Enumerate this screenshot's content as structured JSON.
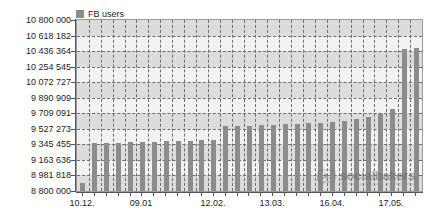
{
  "chart_data": {
    "type": "bar",
    "title": "",
    "subtitle": "",
    "xlabel": "",
    "ylabel": "",
    "ylim": [
      8800000,
      10800000
    ],
    "grid": true,
    "legend_position": "top-left",
    "series": [
      {
        "name": "FB users",
        "color": "#8c8c8c",
        "values": [
          8890000,
          9360000,
          9360000,
          9365000,
          9370000,
          9370000,
          9375000,
          9380000,
          9385000,
          9390000,
          9395000,
          9400000,
          9555000,
          9560000,
          9565000,
          9570000,
          9575000,
          9580000,
          9585000,
          9590000,
          9600000,
          9610000,
          9620000,
          9640000,
          9660000,
          9700000,
          9760000,
          10460000,
          10470000
        ]
      }
    ],
    "y_ticks": [
      "8 800 000",
      "8 981 818",
      "9 163 636",
      "9 345 455",
      "9 527 273",
      "9 709 091",
      "9 890 909",
      "10 072 727",
      "10 254 545",
      "10 436 364",
      "10 618 182",
      "10 800 000"
    ],
    "y_tick_values": [
      8800000,
      8981818,
      9163636,
      9345455,
      9527273,
      9709091,
      9890909,
      10072727,
      10254545,
      10436364,
      10618182,
      10800000
    ],
    "x_tick_labels": [
      "10.12.",
      "09.01",
      "12.02.",
      "13.03.",
      "16.04.",
      "17.05."
    ],
    "x_tick_label_indices": [
      0,
      5,
      11,
      16,
      21,
      26
    ],
    "x_tick_count": 29
  },
  "legend": {
    "items": [
      {
        "label": "FB users",
        "color": "#8c8c8c"
      }
    ]
  },
  "watermark": {
    "name": "socialbakers",
    "tagline": "The fastest growing social marketing company"
  },
  "colors": {
    "bar": "#8c8c8c",
    "plot_background": "#f2f2f2",
    "band": "#dcdcdc",
    "grid": "#6e6e6e",
    "axis": "#555555",
    "text": "#1c1c1c"
  }
}
